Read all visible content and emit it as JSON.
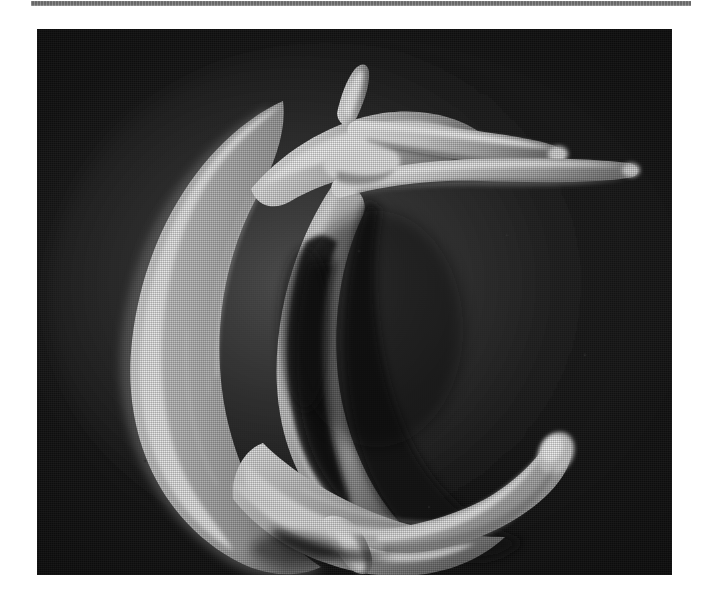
{
  "page": {
    "background_color": "#ffffff",
    "width": 708,
    "height": 603,
    "caption_text": ""
  },
  "top_rule": {
    "name": "horizontal-rule",
    "color": "#5d5d5d",
    "x": 31,
    "y": 1,
    "width": 660,
    "height": 5
  },
  "figure": {
    "kind": "sem-micrograph",
    "title": "",
    "plate": {
      "x": 37,
      "y": 29,
      "width": 635,
      "height": 546,
      "background_color": "#0d0d0d",
      "texture": "halftone-grain"
    },
    "subject": {
      "description": "Crescent-shaped specimen with finger-like projections",
      "orientation": "C-shape opening to the right",
      "body_color": "#b4b4b4",
      "highlight_color": "#ededed",
      "shadow_color": "#5a5a5a",
      "features": [
        {
          "id": "upper-spine",
          "label": "short upward spike",
          "position": "top-center"
        },
        {
          "id": "upper-arm-1",
          "label": "upper elongate tapering arm",
          "position": "upper-right"
        },
        {
          "id": "upper-arm-2",
          "label": "second elongate tapering arm",
          "position": "mid-right-upper"
        },
        {
          "id": "left-arc",
          "label": "thick curved left limb",
          "position": "left"
        },
        {
          "id": "inner-cavity",
          "label": "dark concave inner cavity",
          "position": "center"
        },
        {
          "id": "lower-arm-club",
          "label": "club-shaped lower arm tip",
          "position": "lower-right"
        },
        {
          "id": "ventral-projection",
          "label": "downward ventral projection",
          "position": "bottom-center"
        }
      ]
    }
  }
}
